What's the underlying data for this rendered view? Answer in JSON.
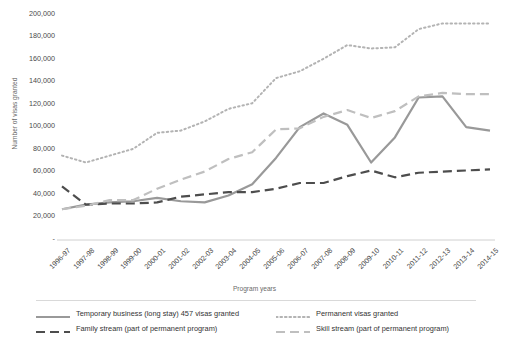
{
  "chart_data": {
    "type": "line",
    "title": "",
    "xlabel": "Program years",
    "ylabel": "Number of visas granted",
    "ylim": [
      0,
      200000
    ],
    "yticks": [
      0,
      20000,
      40000,
      60000,
      80000,
      100000,
      120000,
      140000,
      160000,
      180000,
      200000
    ],
    "ytick_labels": [
      "-",
      "20,000",
      "40,000",
      "60,000",
      "80,000",
      "100,000",
      "120,000",
      "140,000",
      "160,000",
      "180,000",
      "200,000"
    ],
    "grid": false,
    "legend_position": "bottom",
    "categories": [
      "1996-97",
      "1997-98",
      "1998-99",
      "1999-00",
      "2000-01",
      "2001-02",
      "2002-03",
      "2003-04",
      "2004-05",
      "2005-06",
      "2006-07",
      "2007-08",
      "2008-09",
      "2009-10",
      "2010-11",
      "2011-12",
      "2012-13",
      "2013-14",
      "2014-15"
    ],
    "series": [
      {
        "name": "Temporary business (long stay) 457 visas granted",
        "color": "#999999",
        "style": "solid",
        "values": [
          27000,
          31000,
          33000,
          34000,
          37000,
          34000,
          33000,
          39000,
          49000,
          72000,
          99000,
          111000,
          101000,
          68000,
          90000,
          125000,
          126000,
          99000,
          96000
        ]
      },
      {
        "name": "Permanent visas granted",
        "color": "#b3b3b3",
        "style": "dotted",
        "values": [
          74000,
          68000,
          74000,
          80000,
          94000,
          96000,
          104000,
          115000,
          120000,
          142000,
          148000,
          159000,
          171000,
          168000,
          169000,
          185000,
          190000,
          190000,
          190000
        ]
      },
      {
        "name": "Family stream (part of permanent program)",
        "color": "#4d4d4d",
        "style": "dashed",
        "values": [
          47000,
          31000,
          32000,
          32000,
          33000,
          38000,
          40000,
          42000,
          42000,
          45000,
          50000,
          50000,
          56000,
          61000,
          55000,
          59000,
          60000,
          61000,
          62000
        ]
      },
      {
        "name": "Skill stream (part of permanent program)",
        "color": "#bfbfbf",
        "style": "dashed",
        "values": [
          27000,
          30000,
          35000,
          35000,
          45000,
          53000,
          60000,
          71000,
          77000,
          97000,
          98000,
          108000,
          114000,
          107000,
          113000,
          126000,
          129000,
          128000,
          128000
        ]
      }
    ]
  }
}
